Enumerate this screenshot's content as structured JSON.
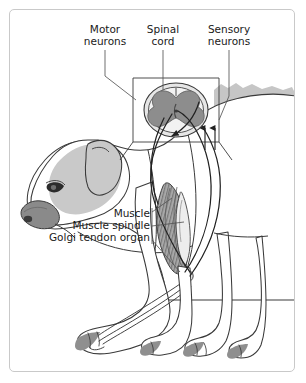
{
  "figure": {
    "border_color": "#c9c9c9",
    "background": "#ffffff"
  },
  "labels": {
    "motor_neurons": "Motor\nneurons",
    "spinal_cord": "Spinal\ncord",
    "sensory_neurons": "Sensory\nneurons",
    "muscle": "Muscle",
    "muscle_spindle": "Muscle spindle",
    "golgi_tendon_organ": "Golgi tendon organ"
  },
  "colors": {
    "outline": "#3a3a3a",
    "fur_light": "#ffffff",
    "fur_patch": "#c9c9c9",
    "muzzle": "#8a8a8a",
    "gray_matter": "#8d8d8d",
    "white_matter": "#e6e6e6",
    "body_shadow": "#c6c6c6",
    "muscle_fill": "#a8a8a8",
    "nerve": "#222222",
    "leader": "#555555"
  },
  "annotations": {
    "arrow_count": 2,
    "arrow_direction": "up",
    "arrow_meaning": "afferent sensory signal toward spinal cord"
  }
}
